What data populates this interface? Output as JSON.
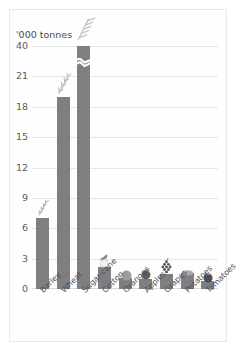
{
  "chart_data": {
    "type": "bar",
    "title": "",
    "subtitle": "",
    "unit_label": "'000 tonnes",
    "xlabel": "",
    "ylabel": "'000 tonnes",
    "categories": [
      "Barley",
      "Wheat",
      "Sugar-cane",
      "Cotton",
      "Oranges",
      "Apples",
      "Grapes",
      "Potatoes",
      "Tomatoes"
    ],
    "values": [
      7.0,
      19.0,
      40.0,
      2.2,
      1.1,
      1.0,
      1.5,
      1.6,
      0.8
    ],
    "ytick_labels": [
      "0",
      "3",
      "6",
      "9",
      "12",
      "15",
      "18",
      "21",
      "40"
    ],
    "ytick_values": [
      0,
      3,
      6,
      9,
      12,
      15,
      18,
      21,
      40
    ],
    "ylim": [
      0,
      40
    ],
    "axis_break": {
      "present": true,
      "between": [
        21,
        40
      ],
      "note": "y-axis is broken between 21 and 40; sugar-cane bar carries a zig-zag break mark"
    },
    "grid": true,
    "legend": false,
    "legend_position": "none",
    "bar_color": "#7f7f82",
    "grid_color": "#e6e6e8",
    "text_color": "#4f4f53",
    "background_color": "#ffffff",
    "annotations": [
      {
        "category": "Barley",
        "icon": "barley-ear-icon"
      },
      {
        "category": "Wheat",
        "icon": "wheat-ear-icon"
      },
      {
        "category": "Sugar-cane",
        "icon": "sugar-cane-icon"
      },
      {
        "category": "Cotton",
        "icon": "cotton-boll-icon"
      },
      {
        "category": "Oranges",
        "icon": "orange-fruit-icon"
      },
      {
        "category": "Apples",
        "icon": "apple-fruit-icon"
      },
      {
        "category": "Grapes",
        "icon": "grape-bunch-icon"
      },
      {
        "category": "Potatoes",
        "icon": "potato-icon"
      },
      {
        "category": "Tomatoes",
        "icon": "tomato-icon"
      }
    ]
  },
  "axis": {
    "unit_caption": "'000 tonnes",
    "ticks": [
      {
        "label": "0"
      },
      {
        "label": "3"
      },
      {
        "label": "6"
      },
      {
        "label": "9"
      },
      {
        "label": "12"
      },
      {
        "label": "15"
      },
      {
        "label": "18"
      },
      {
        "label": "21"
      },
      {
        "label": "40"
      }
    ]
  },
  "bars": [
    {
      "label": "Barley"
    },
    {
      "label": "Wheat"
    },
    {
      "label": "Sugar-cane"
    },
    {
      "label": "Cotton"
    },
    {
      "label": "Oranges"
    },
    {
      "label": "Apples"
    },
    {
      "label": "Grapes"
    },
    {
      "label": "Potatoes"
    },
    {
      "label": "Tomatoes"
    }
  ]
}
